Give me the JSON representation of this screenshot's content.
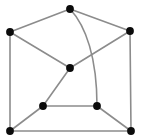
{
  "figure": {
    "width": 144,
    "height": 139,
    "background_color": "#ffffff",
    "edge_color": "#8c8c8c",
    "vertex_color": "#0b0b0b",
    "vertex_radius": 3.9,
    "edge_width": 1.6,
    "vertex_count": "8",
    "edge_count": "12"
  },
  "graph": {
    "vertices": [
      {
        "id": "v-top",
        "label": "",
        "x": 70,
        "y": 9,
        "degree": "3"
      },
      {
        "id": "v-top-left",
        "label": "",
        "x": 10,
        "y": 32,
        "degree": "3"
      },
      {
        "id": "v-top-right",
        "label": "",
        "x": 130,
        "y": 31,
        "degree": "3"
      },
      {
        "id": "v-center",
        "label": "",
        "x": 70,
        "y": 68,
        "degree": "3"
      },
      {
        "id": "v-mid-left",
        "label": "",
        "x": 43,
        "y": 106,
        "degree": "3"
      },
      {
        "id": "v-mid-right",
        "label": "",
        "x": 97,
        "y": 106,
        "degree": "3"
      },
      {
        "id": "v-bottom-left",
        "label": "",
        "x": 10,
        "y": 131,
        "degree": "3"
      },
      {
        "id": "v-bottom-right",
        "label": "",
        "x": 131,
        "y": 131,
        "degree": "3"
      }
    ],
    "edges": [
      {
        "id": "e-top-topleft",
        "from": "v-top",
        "to": "v-top-left",
        "shape": "straight",
        "path": "M 70 9 L 10 32"
      },
      {
        "id": "e-top-topright",
        "from": "v-top",
        "to": "v-top-right",
        "shape": "straight",
        "path": "M 70 9 L 130 31"
      },
      {
        "id": "e-top-midright",
        "from": "v-top",
        "to": "v-mid-right",
        "shape": "curved",
        "path": "M 70 9 C 86 26 97 58 97 106"
      },
      {
        "id": "e-topleft-center",
        "from": "v-top-left",
        "to": "v-center",
        "shape": "straight",
        "path": "M 10 32 L 70 68"
      },
      {
        "id": "e-topleft-bottomleft",
        "from": "v-top-left",
        "to": "v-bottom-left",
        "shape": "straight",
        "path": "M 10 32 L 10 131"
      },
      {
        "id": "e-center-topright",
        "from": "v-center",
        "to": "v-top-right",
        "shape": "straight",
        "path": "M 70 68 L 130 31"
      },
      {
        "id": "e-center-midleft",
        "from": "v-center",
        "to": "v-mid-left",
        "shape": "straight",
        "path": "M 70 68 L 43 106"
      },
      {
        "id": "e-topright-bottomright",
        "from": "v-top-right",
        "to": "v-bottom-right",
        "shape": "straight",
        "path": "M 130 31 L 131 131"
      },
      {
        "id": "e-midleft-midright",
        "from": "v-mid-left",
        "to": "v-mid-right",
        "shape": "straight",
        "path": "M 43 106 L 97 106"
      },
      {
        "id": "e-midleft-bottomleft",
        "from": "v-mid-left",
        "to": "v-bottom-left",
        "shape": "straight",
        "path": "M 43 106 L 10 131"
      },
      {
        "id": "e-midright-bottomright",
        "from": "v-mid-right",
        "to": "v-bottom-right",
        "shape": "straight",
        "path": "M 97 106 L 131 131"
      },
      {
        "id": "e-bottomleft-bottomright",
        "from": "v-bottom-left",
        "to": "v-bottom-right",
        "shape": "straight",
        "path": "M 10 131 L 131 131"
      }
    ]
  }
}
